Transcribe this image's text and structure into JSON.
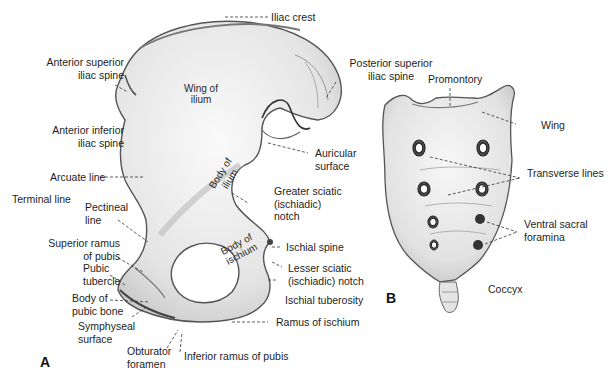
{
  "figure": {
    "caption_fragment": "",
    "panels": [
      {
        "id": "A",
        "label": "A",
        "subject": "hip-bone-lateral-view"
      },
      {
        "id": "B",
        "label": "B",
        "subject": "sacrum-ventral-view"
      }
    ]
  },
  "panel_a": {
    "labels": {
      "iliac_crest": "Iliac crest",
      "ant_sup_iliac_spine_1": "Anterior superior",
      "ant_sup_iliac_spine_2": "iliac spine",
      "post_sup_iliac_spine_1": "Posterior superior",
      "post_sup_iliac_spine_2": "iliac spine",
      "ant_inf_iliac_spine_1": "Anterior inferior",
      "ant_inf_iliac_spine_2": "iliac spine",
      "auricular_surface_1": "Auricular",
      "auricular_surface_2": "surface",
      "arcuate_line": "Arcuate line",
      "terminal_line": "Terminal line",
      "pectineal_line_1": "Pectineal",
      "pectineal_line_2": "line",
      "greater_sciatic_1": "Greater sciatic",
      "greater_sciatic_2": "(ischiadic)",
      "greater_sciatic_3": "notch",
      "sup_ramus_pubis_1": "Superior ramus",
      "sup_ramus_pubis_2": "of pubis",
      "ischial_spine": "Ischial spine",
      "pubic_tubercle_1": "Pubic",
      "pubic_tubercle_2": "tubercle",
      "lesser_sciatic_1": "Lesser sciatic",
      "lesser_sciatic_2": "(ischiadic) notch",
      "body_pubic_bone_1": "Body of",
      "body_pubic_bone_2": "pubic bone",
      "ischial_tuberosity": "Ischial tuberosity",
      "symphyseal_surface_1": "Symphyseal",
      "symphyseal_surface_2": "surface",
      "ramus_ischium": "Ramus of ischium",
      "obturator_foramen_1": "Obturator",
      "obturator_foramen_2": "foramen",
      "inf_ramus_pubis": "Inferior ramus of pubis"
    },
    "inline_labels": {
      "wing_ilium_1": "Wing of",
      "wing_ilium_2": "ilium",
      "body_ilium_1": "Body of",
      "body_ilium_2": "ilium",
      "body_ischium_1": "Body of",
      "body_ischium_2": "ischium"
    }
  },
  "panel_b": {
    "labels": {
      "promontory": "Promontory",
      "wing": "Wing",
      "transverse_lines": "Transverse lines",
      "ventral_sacral_foramina_1": "Ventral sacral",
      "ventral_sacral_foramina_2": "foramina",
      "coccyx": "Coccyx"
    }
  },
  "colors": {
    "bone_fill": "#ececec",
    "bone_shade": "#bdbdbd",
    "outline": "#4a4a4a",
    "leader": "#333333",
    "text": "#1d1d1d",
    "background": "#ffffff"
  }
}
